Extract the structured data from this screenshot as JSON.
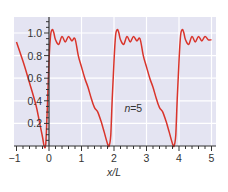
{
  "chart_data": {
    "type": "line",
    "title": "",
    "xlabel": "x/L",
    "ylabel": "",
    "xlim": [
      -1,
      5
    ],
    "ylim": [
      0,
      1.1
    ],
    "grid": true,
    "legend": null,
    "annotations": [
      {
        "text": "n=5",
        "x": 2.75,
        "y": 0.3
      }
    ],
    "x_ticks": [
      -1,
      0,
      1,
      2,
      3,
      4,
      5
    ],
    "x_tick_labels": [
      "−1",
      "0",
      "1",
      "2",
      "3",
      "4",
      "5"
    ],
    "y_ticks": [
      0.2,
      0.4,
      0.6,
      0.8,
      1.0
    ],
    "y_tick_labels": [
      "0.2",
      "0.4",
      "0.6",
      "0.8",
      "1.0"
    ],
    "series": [
      {
        "name": "n=5",
        "color": "#d9342b",
        "x": [
          -1.0,
          -0.8,
          -0.6,
          -0.4,
          -0.3,
          -0.2,
          -0.15,
          -0.1,
          -0.05,
          0.0,
          0.05,
          0.1,
          0.15,
          0.2,
          0.3,
          0.4,
          0.5,
          0.6,
          0.7,
          0.8,
          0.9,
          1.0,
          1.1,
          1.2,
          1.3,
          1.4,
          1.5,
          1.6,
          1.7,
          1.8,
          1.85,
          1.9,
          1.95,
          2.0,
          2.05,
          2.1,
          2.15,
          2.2,
          2.3,
          2.4,
          2.5,
          2.6,
          2.7,
          2.8,
          2.9,
          3.0,
          3.1,
          3.2,
          3.3,
          3.4,
          3.5,
          3.6,
          3.7,
          3.8,
          3.85,
          3.9,
          3.95,
          4.0,
          4.05,
          4.1,
          4.15,
          4.2,
          4.3,
          4.4,
          4.5,
          4.6,
          4.7,
          4.8,
          4.9,
          5.0
        ],
        "values": [
          0.92,
          0.75,
          0.56,
          0.36,
          0.22,
          0.08,
          0.0,
          0.02,
          0.35,
          0.75,
          0.98,
          1.03,
          1.0,
          0.94,
          0.9,
          0.97,
          0.92,
          0.97,
          0.93,
          0.95,
          0.8,
          0.7,
          0.6,
          0.52,
          0.42,
          0.34,
          0.3,
          0.22,
          0.12,
          0.02,
          0.0,
          0.1,
          0.45,
          0.75,
          0.98,
          1.03,
          1.0,
          0.94,
          0.9,
          0.97,
          0.92,
          0.97,
          0.93,
          0.95,
          0.8,
          0.7,
          0.6,
          0.52,
          0.42,
          0.34,
          0.3,
          0.22,
          0.12,
          0.02,
          0.0,
          0.1,
          0.45,
          0.75,
          0.98,
          1.03,
          1.0,
          0.94,
          0.9,
          0.97,
          0.92,
          0.97,
          0.93,
          0.97,
          0.94,
          0.94
        ]
      }
    ]
  },
  "style": {
    "plot_bg": "#e4e4f2",
    "grid_color": "#ffffff",
    "axis_color": "#333333",
    "line_color": "#d9342b"
  }
}
